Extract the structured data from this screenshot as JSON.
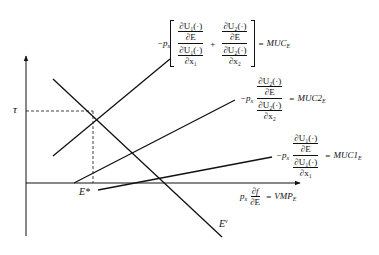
{
  "diagram": {
    "type": "economic-marginal-analysis",
    "axes": {
      "y_label": "τ",
      "x_label": "E*"
    },
    "curves": [
      {
        "id": "muc-e",
        "label": "MUC_E"
      },
      {
        "id": "muc2-e",
        "label": "MUC2_E"
      },
      {
        "id": "muc1-e",
        "label": "MUC1_E"
      },
      {
        "id": "vmp-e",
        "label": "VMP_E"
      },
      {
        "id": "e-v",
        "label": "E^v"
      }
    ],
    "labels": {
      "tau": "τ",
      "e_star": "E*",
      "e_v_main": "E",
      "e_v_sup": "v"
    },
    "eq_muc_e": {
      "prefix": "−p",
      "prefix_sub": "x",
      "t1_num_top": "∂U₁(·)",
      "t1_num_bot": "∂E",
      "t1_den_top": "∂U₁(·)",
      "t1_den_bot": "∂x₁",
      "plus": "+",
      "t2_num_top": "∂U₂(·)",
      "t2_num_bot": "∂E",
      "t2_den_top": "∂U₂(·)",
      "t2_den_bot": "∂x₂",
      "equals": "=",
      "rhs": "MUC",
      "rhs_sub": "E"
    },
    "eq_muc2": {
      "prefix": "−p",
      "prefix_sub": "x",
      "num_top": "∂U₂(·)",
      "num_bot": "∂E",
      "den_top": "∂U₂(·)",
      "den_bot": "∂x₂",
      "equals": "=",
      "rhs": "MUC2",
      "rhs_sub": "E"
    },
    "eq_muc1": {
      "prefix": "−p",
      "prefix_sub": "x",
      "num_top": "∂U₁(·)",
      "num_bot": "∂E",
      "den_top": "∂U₁(·)",
      "den_bot": "∂x₁",
      "equals": "=",
      "rhs": "MUC1",
      "rhs_sub": "E"
    },
    "eq_vmp": {
      "prefix": "p",
      "prefix_sub": "x",
      "num": "∂f",
      "den": "∂E",
      "equals": "=",
      "rhs": "VMP",
      "rhs_sub": "E"
    },
    "colors": {
      "line": "#111111",
      "background": "#ffffff"
    }
  }
}
